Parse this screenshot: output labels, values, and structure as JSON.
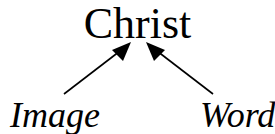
{
  "diagram": {
    "top_node": "Christ",
    "left_node": "Image",
    "right_node": "Word",
    "edges": [
      {
        "from": "Image",
        "to": "Christ"
      },
      {
        "from": "Word",
        "to": "Christ"
      }
    ]
  }
}
